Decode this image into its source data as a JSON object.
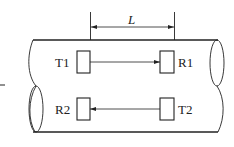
{
  "diagram": {
    "type": "ultrasonic-flowmeter-transit-time",
    "dimension_label": "L",
    "transducers": [
      {
        "id": "T1",
        "label": "T1",
        "role": "transmitter",
        "position": "upstream-top"
      },
      {
        "id": "R1",
        "label": "R1",
        "role": "receiver",
        "position": "downstream-top"
      },
      {
        "id": "R2",
        "label": "R2",
        "role": "receiver",
        "position": "upstream-bottom"
      },
      {
        "id": "T2",
        "label": "T2",
        "role": "transmitter",
        "position": "downstream-bottom"
      }
    ],
    "signal_paths": [
      {
        "from": "T1",
        "to": "R1",
        "direction": "left-to-right"
      },
      {
        "from": "T2",
        "to": "R2",
        "direction": "right-to-left"
      }
    ],
    "colors": {
      "stroke": "#222222",
      "background": "#ffffff"
    }
  }
}
